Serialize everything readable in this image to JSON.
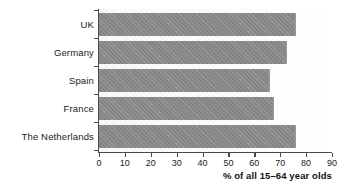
{
  "chart_data": {
    "type": "bar",
    "orientation": "horizontal",
    "title": "",
    "xlabel": "% of all 15–64 year olds",
    "ylabel": "",
    "categories": [
      "UK",
      "Germany",
      "Spain",
      "France",
      "The Netherlands"
    ],
    "values": [
      76,
      72.5,
      66,
      67.5,
      76
    ],
    "xlim": [
      0,
      90
    ],
    "xticks": [
      0,
      10,
      20,
      30,
      40,
      50,
      60,
      70,
      80,
      90
    ],
    "xtick_labels": [
      "0",
      "10",
      "20",
      "30",
      "40",
      "50",
      "60",
      "70",
      "80",
      "90"
    ],
    "grid": false,
    "legend": null,
    "bar_color": "#8c8c8c",
    "plot_background": "#fafafa",
    "axis_color": "#4a4a4a",
    "series": [
      {
        "name": "% of all 15–64 year olds",
        "points": [
          {
            "category": "UK",
            "value": 76
          },
          {
            "category": "Germany",
            "value": 72.5
          },
          {
            "category": "Spain",
            "value": 66
          },
          {
            "category": "France",
            "value": 67.5
          },
          {
            "category": "The Netherlands",
            "value": 76
          }
        ]
      }
    ]
  }
}
